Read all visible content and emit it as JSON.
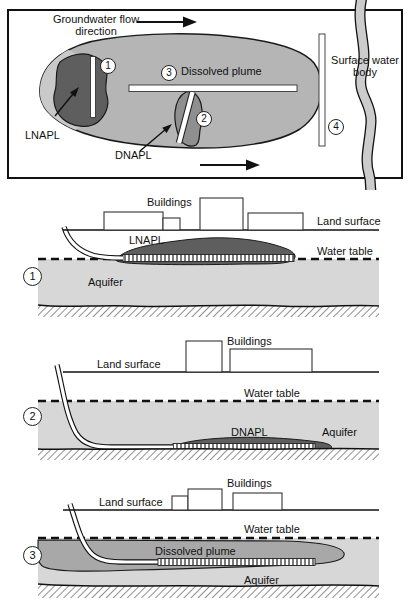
{
  "plan": {
    "flow_label_line1": "Groundwater flow",
    "flow_label_line2": "direction",
    "dissolved_plume_label": "Dissolved plume",
    "lnapl_label": "LNAPL",
    "dnapl_label": "DNAPL",
    "surface_water_line1": "Surface water",
    "surface_water_line2": "body",
    "well_1": "1",
    "well_2": "2",
    "well_3": "3",
    "well_4": "4"
  },
  "sections": [
    {
      "number": "1",
      "buildings": "Buildings",
      "land_surface": "Land surface",
      "contaminant": "LNAPL",
      "water_table": "Water table",
      "aquifer": "Aquifer"
    },
    {
      "number": "2",
      "buildings": "Buildings",
      "land_surface": "Land surface",
      "contaminant": "DNAPL",
      "water_table": "Water table",
      "aquifer": "Aquifer"
    },
    {
      "number": "3",
      "buildings": "Buildings",
      "land_surface": "Land surface",
      "contaminant": "Dissolved plume",
      "water_table": "Water table",
      "aquifer": "Aquifer"
    }
  ],
  "colors": {
    "plume_fill": "#b5b5b5",
    "plume_tip_fill": "#c9c9c9",
    "lnapl_fill": "#5e5e5e",
    "dnapl_plan_fill": "#8f8f8f",
    "napl_section_fill": "#5e5e5e",
    "dissolved_section_fill": "#a8a8a8",
    "aquifer_fill": "#d7d7d7",
    "river_fill": "#cccccc",
    "line": "#1a1a1a"
  }
}
